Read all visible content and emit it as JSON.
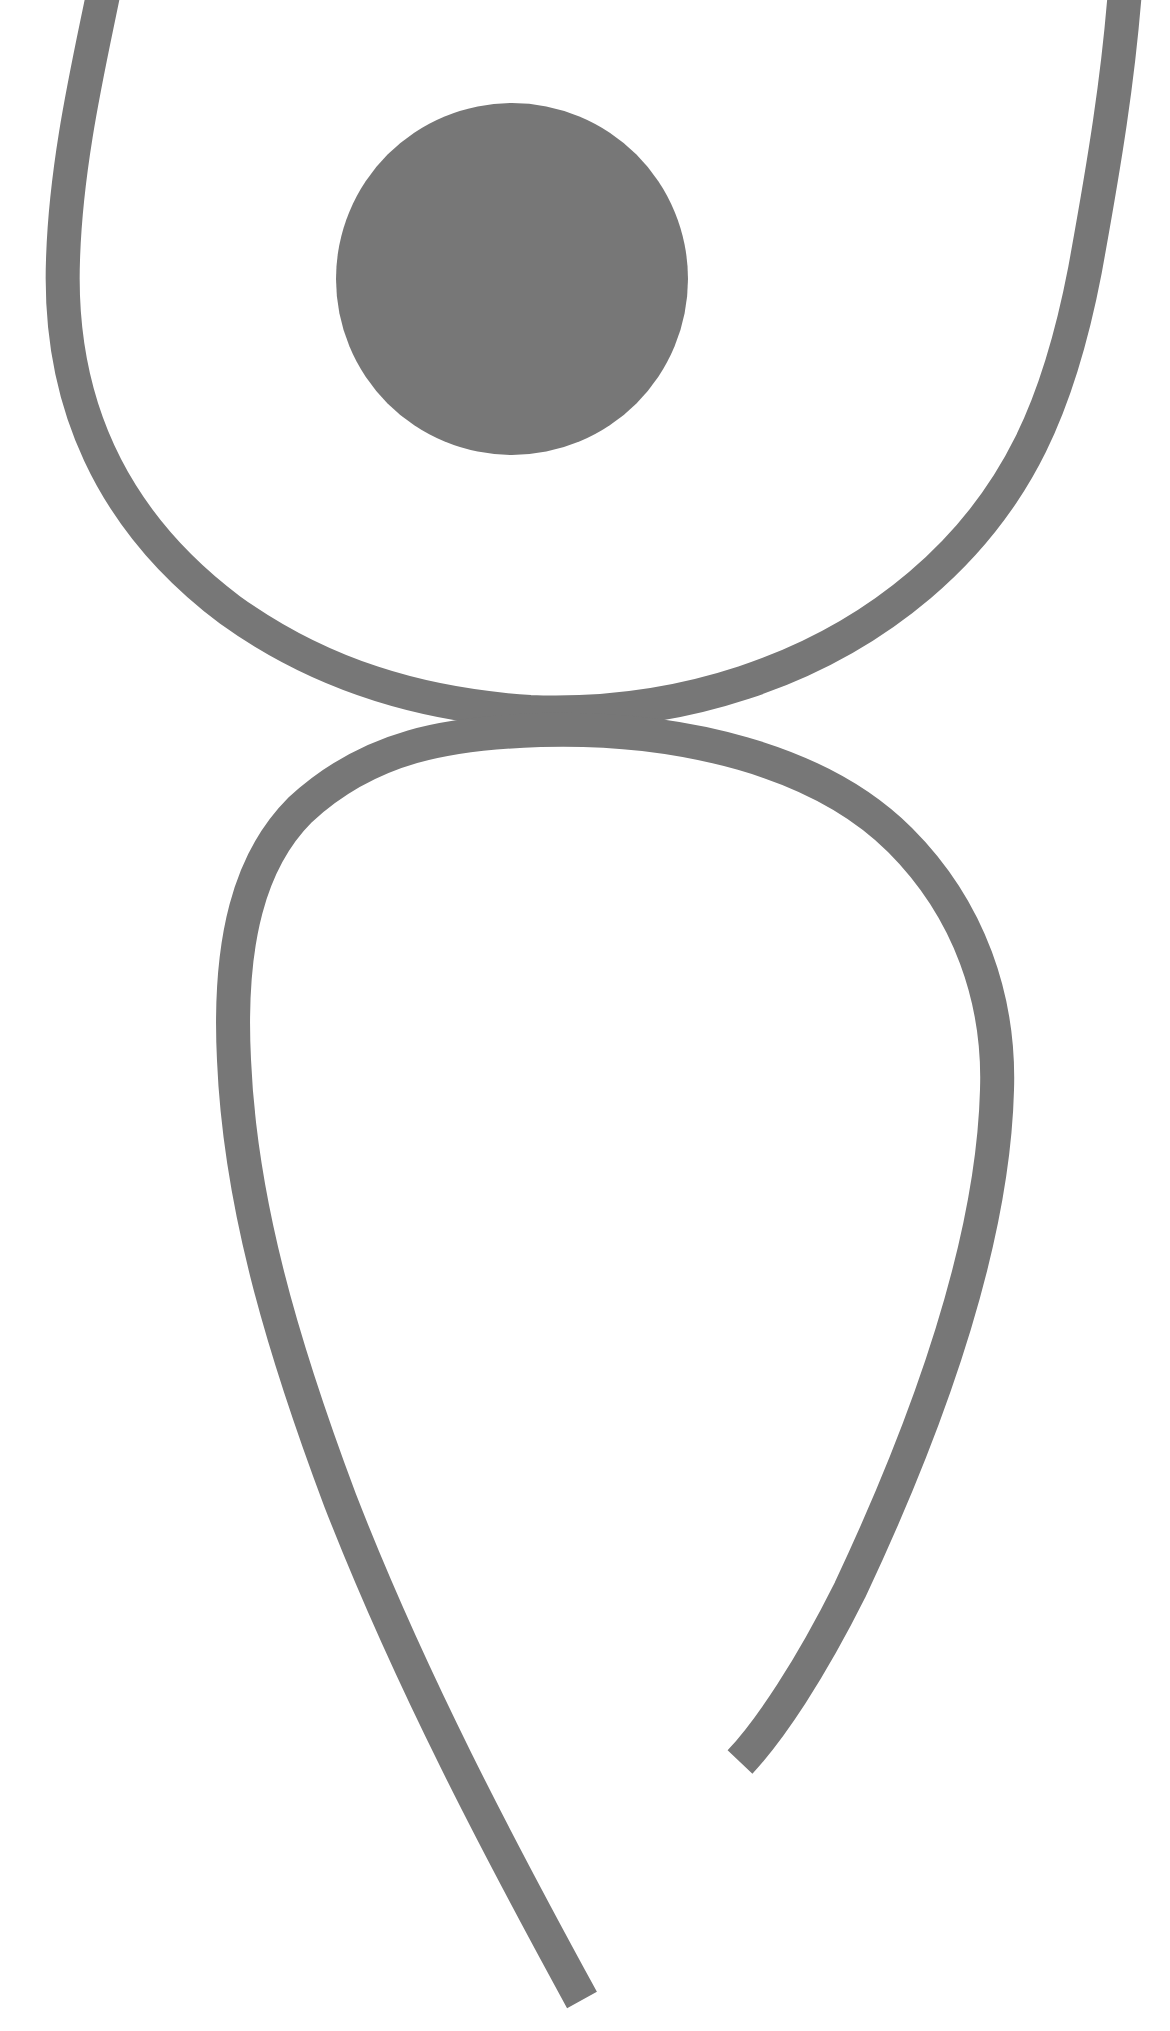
{
  "illustration": {
    "subject": "abstract stylized human figure",
    "background_color": "#ffffff",
    "figure_color": "#777777",
    "stroke_width": 34,
    "head": {
      "shape": "filled-circle",
      "cx": 512,
      "cy": 279,
      "r": 176
    },
    "upper_arc": {
      "description": "open U-shaped stroke forming arms/shoulders, ends leave top edge"
    },
    "lower_loop": {
      "description": "inverted teardrop stroke forming body, open at bottom with two unequal ends"
    }
  }
}
